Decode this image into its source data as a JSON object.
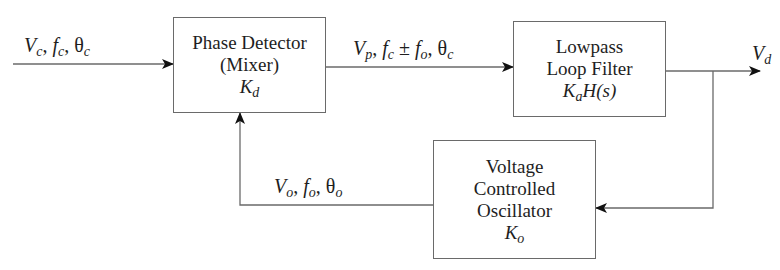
{
  "diagram": {
    "type": "block-diagram",
    "blocks": [
      {
        "id": "phase-detector",
        "lines": [
          "Phase Detector",
          "(Mixer)"
        ],
        "gain": {
          "symbol": "K",
          "sub": "d"
        }
      },
      {
        "id": "loop-filter",
        "lines": [
          "Lowpass",
          "Loop Filter"
        ],
        "gain": {
          "symbol": "K",
          "sub": "a",
          "suffix": "H(s)"
        }
      },
      {
        "id": "vco",
        "lines": [
          "Voltage",
          "Controlled",
          "Oscillator"
        ],
        "gain": {
          "symbol": "K",
          "sub": "o"
        }
      }
    ],
    "signals": {
      "input": {
        "v": "V",
        "v_sub": "c",
        "f": "f",
        "f_sub": "c",
        "theta": "θ",
        "theta_sub": "c",
        "sep": ", "
      },
      "mixer_out": {
        "v": "V",
        "v_sub": "p",
        "f": "f",
        "f_sub": "c",
        "pm": " ± ",
        "f2": "f",
        "f2_sub": "o",
        "theta": "θ",
        "theta_sub": "c",
        "sep": ", "
      },
      "output": {
        "v": "V",
        "v_sub": "d"
      },
      "feedback": {
        "v": "V",
        "v_sub": "o",
        "f": "f",
        "f_sub": "o",
        "theta": "θ",
        "theta_sub": "o",
        "sep": ", "
      }
    },
    "connections": [
      {
        "from": "input",
        "to": "phase-detector"
      },
      {
        "from": "phase-detector",
        "to": "loop-filter"
      },
      {
        "from": "loop-filter",
        "to": "output"
      },
      {
        "from": "loop-filter",
        "to": "vco"
      },
      {
        "from": "vco",
        "to": "phase-detector"
      }
    ],
    "colors": {
      "line": "#6a6a6a",
      "arrow": "#111111",
      "text": "#1e1e1e"
    }
  }
}
